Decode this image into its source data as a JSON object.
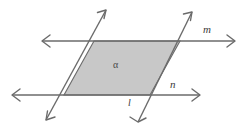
{
  "figure": {
    "background_color": "#ffffff",
    "stroke_color": "#6b6b6b",
    "region_fill_color": "#c8c8c8",
    "region_stroke_color": "#6b6b6b",
    "label_color": "#3a3a3a",
    "labels": {
      "line_m": "m",
      "line_n": "n",
      "line_l": "l",
      "region_alpha": "α"
    },
    "lines": [
      {
        "name": "line-m",
        "label": "m",
        "type": "double-arrow-line",
        "orientation": "horizontal",
        "x1": 42,
        "y1": 41,
        "x2": 235,
        "y2": 41
      },
      {
        "name": "line-n",
        "label": "n",
        "type": "double-arrow-line",
        "orientation": "horizontal",
        "x1": 12,
        "y1": 95,
        "x2": 200,
        "y2": 95
      },
      {
        "name": "transversal-left",
        "label": "",
        "type": "double-arrow-line",
        "orientation": "diagonal",
        "x1": 46,
        "y1": 120,
        "x2": 106,
        "y2": 10
      },
      {
        "name": "transversal-right",
        "label": "l",
        "type": "double-arrow-line",
        "orientation": "diagonal",
        "x1": 138,
        "y1": 122,
        "x2": 192,
        "y2": 12
      }
    ],
    "region": {
      "name": "parallelogram-alpha",
      "label": "α",
      "vertices": [
        {
          "x": 94,
          "y": 41
        },
        {
          "x": 180,
          "y": 41
        },
        {
          "x": 150,
          "y": 95
        },
        {
          "x": 64,
          "y": 95
        }
      ]
    }
  }
}
